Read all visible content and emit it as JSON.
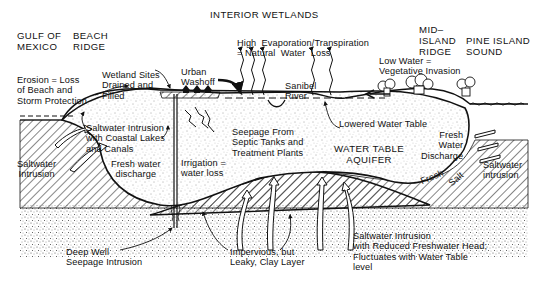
{
  "title": "INTERIOR WETLANDS",
  "regions": {
    "gulf": "GULF OF\nMEXICO",
    "beach_ridge": "BEACH\nRIDGE",
    "mid_island_ridge": "MID–\nISLAND\nRIDGE",
    "pine_island_sound": "PINE ISLAND\nSOUND"
  },
  "labels": {
    "erosion": "Erosion = Loss\nof Beach and\nStorm Protection",
    "wetland_sites": "Wetland Sites\nDrained and\nFilled",
    "urban_washoff": "Urban\nWashoff",
    "evaporation": "High  Evaporation/Transpiration\n= Natural  Water  Loss",
    "sanibel_river": "Sanibel\nRiver",
    "low_water": "Low Water =\nVegetative Invasion",
    "lowered_water_table": "Lowered Water Table",
    "saltwater_intrusion_lakes": "Saltwater Intrusion\nwith Coastal Lakes\nand Canals",
    "seepage_septic": "Seepage From\nSeptic Tanks and\nTreatment Plants",
    "water_table_aquifer": "WATER TABLE\nAQUIFER",
    "fresh_water_discharge_left": "Fresh water\ndischarge",
    "saltwater_intrusion_left": "Saltwater\nIntrusion",
    "irrigation": "Irrigation =\nwater loss",
    "fresh_water_discharge_right": "Fresh\nWater\nDischarge",
    "saltwater_intrusion_right": "Saltwater\nintrusion",
    "fresh": "Fresh",
    "salt": "Salt",
    "deep_well": "Deep Well\nSeepage Intrusion",
    "impervious": "Impervious, but\nLeaky, Clay Layer",
    "saltwater_reduced_head": "Saltwater Intrusion\nwith Reduced Freshwater Head;\nFluctuates with Water Table\nlevel"
  }
}
